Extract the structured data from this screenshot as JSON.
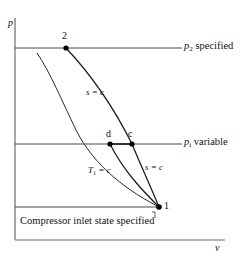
{
  "figure": {
    "type": "pv-diagram",
    "axes": {
      "y_label": "p",
      "x_label": "v"
    },
    "pressure_lines": [
      {
        "id": "p2",
        "label_main": "p",
        "label_sub": "2",
        "label_tail": " specified",
        "y": 48
      },
      {
        "id": "pi",
        "label_main": "p",
        "label_sub": "i",
        "label_tail": " variable",
        "y": 144
      },
      {
        "id": "p1",
        "label_main": "",
        "label_sub": "",
        "label_tail": "",
        "y": 207
      }
    ],
    "state_points": [
      {
        "id": "2",
        "label": "2",
        "x": 66,
        "y": 48
      },
      {
        "id": "d",
        "label": "d",
        "x": 110,
        "y": 144
      },
      {
        "id": "c",
        "label": "c",
        "x": 132,
        "y": 144
      },
      {
        "id": "1",
        "label": "1",
        "x": 159,
        "y": 207
      }
    ],
    "process_labels": [
      {
        "id": "s-c-upper",
        "text": "s = c"
      },
      {
        "id": "s-c-lower",
        "text": "s = c"
      },
      {
        "id": "t1-c",
        "main": "T",
        "sub": "1",
        "tail": " = c"
      }
    ],
    "annotation": {
      "inlet_note": "Compressor inlet state specified"
    },
    "colors": {
      "line": "#3a3a3a",
      "curve": "#222222",
      "axis": "#555555",
      "point": "#000000",
      "background": "#ffffff"
    }
  }
}
